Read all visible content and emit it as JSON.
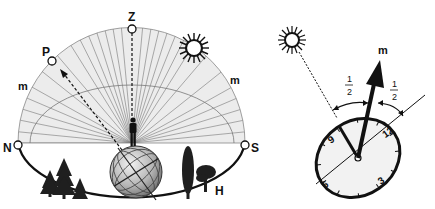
{
  "left_diagram": {
    "title": "Celestial sphere over observer",
    "labels": {
      "zenith": "Z",
      "pole": "P",
      "meridian_left": "m",
      "meridian_right": "m",
      "north": "N",
      "south": "S",
      "horizon": "H"
    },
    "icons": [
      "sun-icon",
      "observer-figure",
      "globe-icon",
      "trees-left",
      "trees-right"
    ]
  },
  "right_diagram": {
    "title": "Watch-as-compass method",
    "labels": {
      "meridian": "m",
      "half_left_num": "1",
      "half_left_den": "2",
      "half_right_num": "1",
      "half_right_den": "2"
    },
    "watch_numbers": {
      "twelve": "12",
      "three": "3",
      "six": "6",
      "nine": "9"
    },
    "icons": [
      "sun-icon",
      "watch-icon",
      "arrow-icon"
    ]
  },
  "colors": {
    "ink": "#111111",
    "sphere_fill": "#ececec",
    "globe_fill": "#bdbdbd",
    "watch_face": "#f2f2f2"
  }
}
